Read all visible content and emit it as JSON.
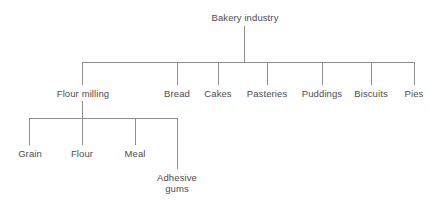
{
  "diagram": {
    "type": "tree",
    "background_color": "#ffffff",
    "line_color": "#8d8d8d",
    "text_color": "#4d4d4d",
    "root": {
      "label": "Bakery industry"
    },
    "level2": [
      {
        "label": "Flour milling"
      },
      {
        "label": "Bread"
      },
      {
        "label": "Cakes"
      },
      {
        "label": "Pasteries"
      },
      {
        "label": "Puddings"
      },
      {
        "label": "Biscuits"
      },
      {
        "label": "Pies"
      }
    ],
    "level3_parent": "Flour milling",
    "level3": [
      {
        "label": "Grain",
        "line1": "Grain",
        "line2": ""
      },
      {
        "label": "Flour",
        "line1": "Flour",
        "line2": ""
      },
      {
        "label": "Meal",
        "line1": "Meal",
        "line2": ""
      },
      {
        "label": "Adhesive gums",
        "line1": "Adhesive",
        "line2": "gums"
      }
    ]
  }
}
